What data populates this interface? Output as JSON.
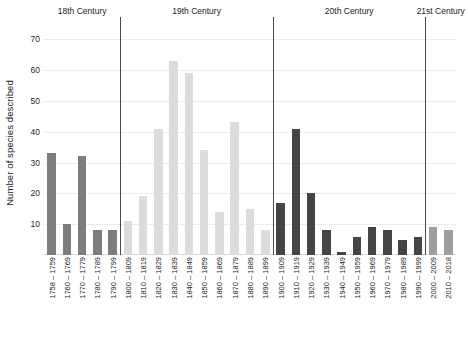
{
  "chart_data": {
    "type": "bar",
    "title": "",
    "xlabel": "",
    "ylabel": "Number of species described",
    "ylim": [
      0,
      73
    ],
    "yticks": [
      10,
      20,
      30,
      40,
      50,
      60,
      70
    ],
    "grid": true,
    "legend": "none",
    "group_label_position": "top",
    "categories": [
      "1758 – 1759",
      "1760 – 1769",
      "1770 – 1779",
      "1780 – 1789",
      "1790 – 1799",
      "1800 – 1809",
      "1810 – 1819",
      "1820 – 1829",
      "1830 – 1839",
      "1840 – 1849",
      "1850 – 1859",
      "1860 – 1869",
      "1870 – 1879",
      "1880 – 1889",
      "1890 – 1899",
      "1900 – 1909",
      "1910 – 1919",
      "1920 – 1929",
      "1930 – 1939",
      "1940 – 1949",
      "1950 – 1959",
      "1960 – 1969",
      "1970 – 1979",
      "1980 – 1989",
      "1990 – 1999",
      "2000 – 2009",
      "2010 – 2018"
    ],
    "values": [
      33,
      10,
      32,
      8,
      8,
      11,
      19,
      41,
      63,
      59,
      34,
      14,
      43,
      15,
      8,
      17,
      41,
      20,
      8,
      1,
      6,
      9,
      8,
      5,
      6,
      9,
      8
    ],
    "groups": [
      {
        "label": "18th Century",
        "start": 0,
        "end": 4,
        "color": "#7d7d7d"
      },
      {
        "label": "19th Century",
        "start": 5,
        "end": 14,
        "color": "#dcdcdc"
      },
      {
        "label": "20th Century",
        "start": 15,
        "end": 24,
        "color": "#454545"
      },
      {
        "label": "21st Century",
        "start": 25,
        "end": 26,
        "color": "#9e9e9e"
      }
    ],
    "colors": {
      "grid": "#ececec",
      "axis": "#d8d8d8",
      "divider": "#4a4a4a",
      "text": "#1a1a1a"
    }
  }
}
